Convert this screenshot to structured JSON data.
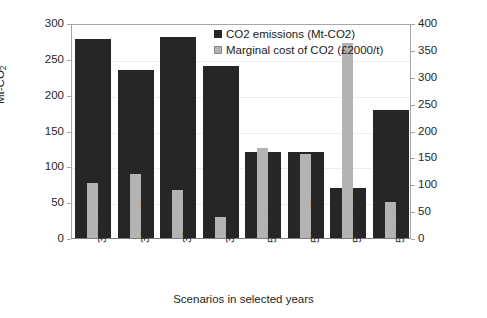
{
  "chart_data": {
    "type": "bar",
    "title": "",
    "xlabel": "Scenarios in selected years",
    "ylabel": "Mt-CO2",
    "ylabel_main": "Mt-CO",
    "ylabel_sub": "2",
    "categories": [
      "35-LC",
      "35-LC-EA",
      "35-LC-LC",
      "35-LC-SO",
      "50-LC",
      "50-LC-EA",
      "50-LC-LC",
      "50-LC-SO"
    ],
    "series": [
      {
        "name": "CO2 emissions (Mt-CO2)",
        "axis": "left",
        "color": "#262626",
        "values": [
          278,
          234,
          281,
          240,
          120,
          120,
          70,
          178
        ]
      },
      {
        "name": "Marginal cost of CO2 (£2000/t)",
        "axis": "right",
        "color": "#b3b3b3",
        "values": [
          102,
          119,
          89,
          39,
          167,
          157,
          363,
          67
        ]
      }
    ],
    "ylim": [
      0,
      300
    ],
    "y_ticks": [
      0,
      50,
      100,
      150,
      200,
      250,
      300
    ],
    "y2lim": [
      0,
      400
    ],
    "y2_ticks": [
      0,
      50,
      100,
      150,
      200,
      250,
      300,
      350,
      400
    ],
    "grid": true,
    "legend_position": "top-right"
  },
  "legend": {
    "items": [
      {
        "label": "CO2 emissions (Mt-CO2)",
        "swatch": "co2"
      },
      {
        "label": "Marginal cost of CO2 (£2000/t)",
        "swatch": "cost"
      }
    ]
  },
  "axis": {
    "y_left_ticks": [
      "300",
      "250",
      "200",
      "150",
      "100",
      "50",
      "0"
    ],
    "y_right_ticks": [
      "400",
      "350",
      "300",
      "250",
      "200",
      "150",
      "100",
      "50",
      "0"
    ],
    "y_title": "Mt-CO",
    "y_title_sub": "2",
    "x_title": "Scenarios in selected years"
  }
}
